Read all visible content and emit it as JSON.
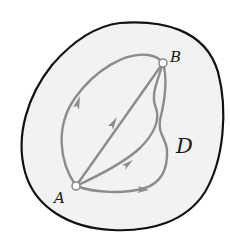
{
  "diagram": {
    "type": "path-independence region diagram",
    "region": {
      "label": "D",
      "fill_color": "#f2f2f2",
      "border_color": "#111111"
    },
    "points": [
      {
        "id": "A",
        "label": "A"
      },
      {
        "id": "B",
        "label": "B"
      }
    ],
    "paths": [
      {
        "id": "path-left-arc",
        "from": "A",
        "to": "B",
        "description": "upper-left arc"
      },
      {
        "id": "path-straight",
        "from": "A",
        "to": "B",
        "description": "straight segment"
      },
      {
        "id": "path-right-curve",
        "from": "A",
        "to": "B",
        "description": "curve to the right with inflection"
      },
      {
        "id": "path-bottom-loop",
        "from": "A",
        "to": "B",
        "description": "lower curve joining right loop"
      }
    ],
    "path_color": "#8c8c8c"
  }
}
